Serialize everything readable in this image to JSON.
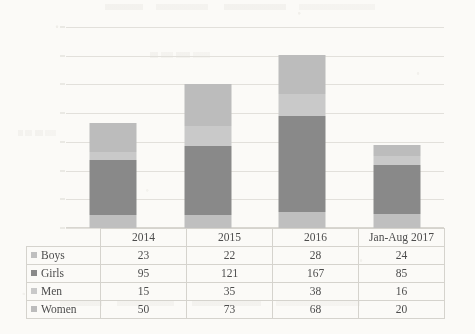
{
  "chart_data": {
    "type": "bar",
    "subtype": "stacked-column",
    "title": "",
    "xlabel": "",
    "ylabel": "",
    "ylim": [
      0,
      350
    ],
    "ytick_step": 50,
    "yticks": [
      0,
      50,
      100,
      150,
      200,
      250,
      300,
      350
    ],
    "grid": true,
    "legend_position": "table-row-labels",
    "categories": [
      "2014",
      "2015",
      "2016",
      "Jan-Aug 2017"
    ],
    "series": [
      {
        "name": "Boys",
        "values": [
          23,
          22,
          28,
          24
        ],
        "color": "#bfbfbf"
      },
      {
        "name": "Girls",
        "values": [
          95,
          121,
          167,
          85
        ],
        "color": "#898989"
      },
      {
        "name": "Men",
        "values": [
          15,
          35,
          38,
          16
        ],
        "color": "#c9c9c9"
      },
      {
        "name": "Women",
        "values": [
          50,
          73,
          68,
          20
        ],
        "color": "#bcbcbc"
      }
    ],
    "totals": [
      183,
      251,
      301,
      145
    ]
  },
  "table": {
    "corner_label": "",
    "column_headers": [
      "2014",
      "2015",
      "2016",
      "Jan-Aug 2017"
    ],
    "rows": [
      {
        "label": "Boys",
        "swatch_color": "#bfbfbf",
        "cells": [
          "23",
          "22",
          "28",
          "24"
        ]
      },
      {
        "label": "Girls",
        "swatch_color": "#898989",
        "cells": [
          "95",
          "121",
          "167",
          "85"
        ]
      },
      {
        "label": "Men",
        "swatch_color": "#c9c9c9",
        "cells": [
          "15",
          "35",
          "38",
          "16"
        ]
      },
      {
        "label": "Women",
        "swatch_color": "#bcbcbc",
        "cells": [
          "50",
          "73",
          "68",
          "20"
        ]
      }
    ]
  },
  "axis": {
    "y_labels": [
      "350",
      "300",
      "250",
      "200",
      "150",
      "100",
      "50",
      "0"
    ]
  },
  "colors": {
    "page_background": "#fbfaf7",
    "gridline": "#e2e0db",
    "table_border": "#d5d3cd",
    "text": "#4a4a4a"
  }
}
